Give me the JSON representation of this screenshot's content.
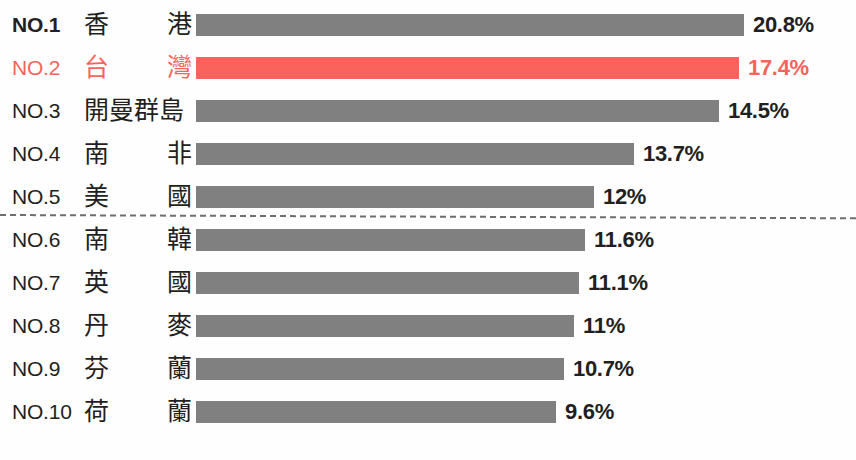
{
  "chart_data": {
    "type": "bar",
    "orientation": "horizontal",
    "title": "",
    "xlabel": "",
    "ylabel": "",
    "grid": false,
    "legend": false,
    "xlim": [
      0,
      20.8
    ],
    "highlight_color": "#f9635c",
    "bar_color": "#808080",
    "highlight_index": 1,
    "divider_after_index": 4,
    "categories": [
      "香港",
      "台灣",
      "開曼群島",
      "南非",
      "美國",
      "南韓",
      "英國",
      "丹麥",
      "芬蘭",
      "荷蘭"
    ],
    "values": [
      20.8,
      17.4,
      14.5,
      13.7,
      12,
      11.6,
      11.1,
      11,
      10.7,
      9.6
    ],
    "value_labels": [
      "20.8%",
      "17.4%",
      "14.5%",
      "13.7%",
      "12%",
      "11.6%",
      "11.1%",
      "11%",
      "10.7%",
      "9.6%"
    ],
    "rank_labels": [
      "NO.1",
      "NO.2",
      "NO.3",
      "NO.4",
      "NO.5",
      "NO.6",
      "NO.7",
      "NO.8",
      "NO.9",
      "NO.10"
    ]
  },
  "rows": [
    {
      "rank": "NO.1",
      "c1": "香",
      "c2": "港",
      "name": "香港",
      "value": "20.8%",
      "width": 548,
      "highlight": false,
      "bold": true,
      "wide": false
    },
    {
      "rank": "NO.2",
      "c1": "台",
      "c2": "灣",
      "name": "台灣",
      "value": "17.4%",
      "width": 543,
      "highlight": true,
      "bold": false,
      "wide": false
    },
    {
      "rank": "NO.3",
      "c1": "開曼群島",
      "c2": "",
      "name": "開曼群島",
      "value": "14.5%",
      "width": 523,
      "highlight": false,
      "bold": false,
      "wide": true
    },
    {
      "rank": "NO.4",
      "c1": "南",
      "c2": "非",
      "name": "南非",
      "value": "13.7%",
      "width": 438,
      "highlight": false,
      "bold": false,
      "wide": false
    },
    {
      "rank": "NO.5",
      "c1": "美",
      "c2": "國",
      "name": "美國",
      "value": "12%",
      "width": 398,
      "highlight": false,
      "bold": false,
      "wide": false
    },
    {
      "rank": "NO.6",
      "c1": "南",
      "c2": "韓",
      "name": "南韓",
      "value": "11.6%",
      "width": 389,
      "highlight": false,
      "bold": false,
      "wide": false
    },
    {
      "rank": "NO.7",
      "c1": "英",
      "c2": "國",
      "name": "英國",
      "value": "11.1%",
      "width": 383,
      "highlight": false,
      "bold": false,
      "wide": false
    },
    {
      "rank": "NO.8",
      "c1": "丹",
      "c2": "麥",
      "name": "丹麥",
      "value": "11%",
      "width": 378,
      "highlight": false,
      "bold": false,
      "wide": false
    },
    {
      "rank": "NO.9",
      "c1": "芬",
      "c2": "蘭",
      "name": "芬蘭",
      "value": "10.7%",
      "width": 368,
      "highlight": false,
      "bold": false,
      "wide": false
    },
    {
      "rank": "NO.10",
      "c1": "荷",
      "c2": "蘭",
      "name": "荷蘭",
      "value": "9.6%",
      "width": 360,
      "highlight": false,
      "bold": false,
      "wide": false
    }
  ]
}
